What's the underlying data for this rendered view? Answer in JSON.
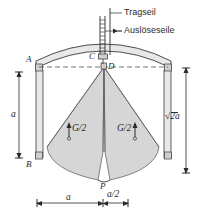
{
  "figure": {
    "type": "engineering-diagram",
    "language": "de",
    "background_color": "#ffffff",
    "ink_color": "#2b2b2b",
    "fill_color": "#d6d6d6",
    "shell_fill_color": "#e8e8e8"
  },
  "callouts": [
    {
      "id": "tragseil",
      "label": "Tragseil"
    },
    {
      "id": "ausloeseseile",
      "label": "Auslöseseile"
    }
  ],
  "points": [
    {
      "id": "A",
      "label": "A"
    },
    {
      "id": "B",
      "label": "B"
    },
    {
      "id": "C",
      "label": "C"
    },
    {
      "id": "D",
      "label": "D"
    },
    {
      "id": "P",
      "label": "P"
    }
  ],
  "forces": [
    {
      "id": "left-weight",
      "label": "G/2",
      "direction": "down"
    },
    {
      "id": "right-weight",
      "label": "G/2",
      "direction": "down"
    }
  ],
  "dimensions": [
    {
      "id": "left-vertical",
      "label": "a",
      "orientation": "vertical",
      "side": "left"
    },
    {
      "id": "right-vertical",
      "label": "2a",
      "prefix": "√",
      "display": "√2a",
      "orientation": "vertical",
      "side": "right"
    },
    {
      "id": "bottom-a",
      "label": "a",
      "orientation": "horizontal",
      "side": "bottom"
    },
    {
      "id": "bottom-a-half",
      "label": "a/2",
      "orientation": "horizontal",
      "side": "bottom"
    }
  ]
}
